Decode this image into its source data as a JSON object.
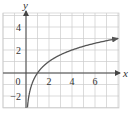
{
  "chart_data": {
    "type": "line",
    "title": "",
    "xlabel": "x",
    "ylabel": "y",
    "xlim": [
      -2,
      8
    ],
    "ylim": [
      -3,
      5
    ],
    "grid": true,
    "x_ticks": [
      0,
      2,
      4,
      6
    ],
    "y_ticks": [
      -2,
      2,
      4
    ],
    "x_tick_labels": [
      "0",
      "2",
      "4",
      "6"
    ],
    "y_tick_labels": [
      "-2",
      "2",
      "4"
    ],
    "series": [
      {
        "name": "y = log2(x)",
        "x": [
          0.125,
          0.25,
          0.5,
          1,
          2,
          4,
          6,
          8
        ],
        "y": [
          -3,
          -2,
          -1,
          0,
          1,
          2,
          2.585,
          3
        ]
      }
    ],
    "colors": {
      "curve": "#555555",
      "axes": "#444444",
      "grid": "#cccccc"
    }
  },
  "labels": {
    "x_axis": "x",
    "y_axis": "y",
    "origin": "0"
  }
}
